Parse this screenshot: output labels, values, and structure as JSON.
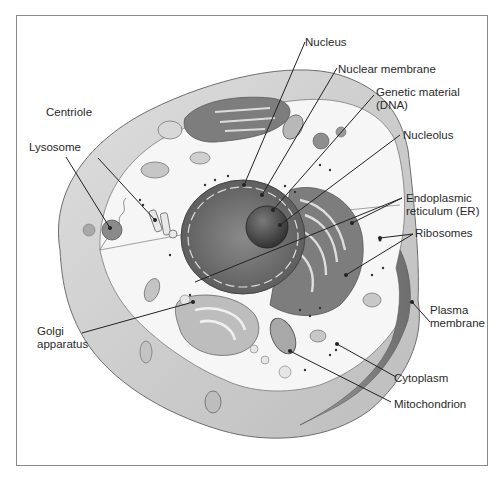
{
  "diagram": {
    "colors": {
      "frame": "#8a8a8a",
      "cell_outer": "#cfcfcf",
      "cytoplasm": "#f4f4f4",
      "nucleus": "#6e6e6e",
      "nucleolus": "#3c3c3c",
      "er": "#8c8c8c",
      "leader": "#222222",
      "text": "#2a2a2a"
    },
    "labels": {
      "nucleus": {
        "lines": [
          "Nucleus"
        ]
      },
      "nuclear_membrane": {
        "lines": [
          "Nuclear membrane"
        ]
      },
      "genetic_material": {
        "lines": [
          "Genetic material",
          "(DNA)"
        ]
      },
      "nucleolus": {
        "lines": [
          "Nucleolus"
        ]
      },
      "centriole": {
        "lines": [
          "Centriole"
        ]
      },
      "lysosome": {
        "lines": [
          "Lysosome"
        ]
      },
      "er": {
        "lines": [
          "Endoplasmic",
          "reticulum (ER)"
        ]
      },
      "ribosomes": {
        "lines": [
          "Ribosomes"
        ]
      },
      "golgi": {
        "lines": [
          "Golgi",
          "apparatus"
        ]
      },
      "plasma_membrane": {
        "lines": [
          "Plasma",
          "membrane"
        ]
      },
      "cytoplasm": {
        "lines": [
          "Cytoplasm"
        ]
      },
      "mitochondrion": {
        "lines": [
          "Mitochondrion"
        ]
      }
    }
  }
}
